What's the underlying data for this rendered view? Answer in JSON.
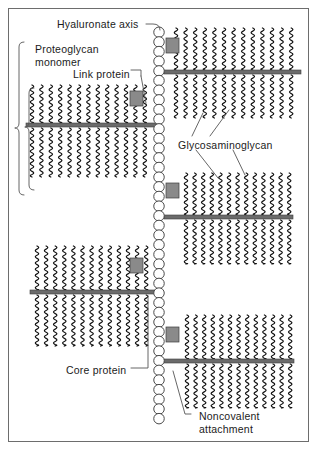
{
  "figure": {
    "background": "#ffffff",
    "frame_color": "#6d6d6d",
    "colors": {
      "core_protein": "#6b6b6b",
      "link_protein": "#8a8a8a",
      "gag_chain": "#111111",
      "hyaluronate_circle_stroke": "#4a4a4a",
      "leader_line": "#555555",
      "text": "#1b1b1b"
    },
    "labels": [
      {
        "id": "hyaluronate-axis",
        "text": "Hyaluronate axis",
        "x": 57,
        "y": 18,
        "lines": 1
      },
      {
        "id": "proteoglycan-monomer",
        "text": "Proteoglycan\nmonomer",
        "x": 35,
        "y": 43,
        "lines": 2
      },
      {
        "id": "link-protein",
        "text": "Link protein",
        "x": 73,
        "y": 68,
        "lines": 1
      },
      {
        "id": "glycosaminoglycan",
        "text": "Glycosaminoglycan",
        "x": 178,
        "y": 139,
        "lines": 1
      },
      {
        "id": "core-protein",
        "text": "Core protein",
        "x": 66,
        "y": 364,
        "lines": 1
      },
      {
        "id": "noncovalent-attachment",
        "text": "Noncovalent\nattachment",
        "x": 199,
        "y": 410,
        "lines": 2
      }
    ],
    "hyaluronate_axis": {
      "name": "hyaluronate-axis-chain",
      "x_center": 159,
      "y_top": 27,
      "y_bottom": 430,
      "circle_diameter": 10.5,
      "circle_count": 40
    },
    "proteoglycan_monomers": [
      {
        "id": "monomer-right-1",
        "side": "right",
        "core_y": 72,
        "core_x1": 164,
        "core_x2": 301,
        "link_x": 166,
        "link_y": 51,
        "gag_count": 13,
        "gag_top_len": 44,
        "gag_bottom_len": 46,
        "gag_x_start": 176,
        "gag_spacing": 9.6
      },
      {
        "id": "monomer-left-1",
        "side": "left",
        "core_y": 125,
        "core_x1": 26,
        "core_x2": 156,
        "link_x": 143,
        "link_y": 104,
        "gag_count": 13,
        "gag_top_len": 40,
        "gag_bottom_len": 52,
        "gag_x_start": 32,
        "gag_spacing": 9.4
      },
      {
        "id": "monomer-right-2",
        "side": "right",
        "core_y": 217,
        "core_x1": 164,
        "core_x2": 293,
        "link_x": 166,
        "link_y": 196,
        "gag_count": 13,
        "gag_top_len": 44,
        "gag_bottom_len": 47,
        "gag_x_start": 186,
        "gag_spacing": 8.6
      },
      {
        "id": "monomer-left-2",
        "side": "left",
        "core_y": 292,
        "core_x1": 30,
        "core_x2": 156,
        "link_x": 143,
        "link_y": 271,
        "gag_count": 13,
        "gag_top_len": 46,
        "gag_bottom_len": 54,
        "gag_x_start": 37,
        "gag_spacing": 9.1
      },
      {
        "id": "monomer-right-3",
        "side": "right",
        "core_y": 361,
        "core_x1": 164,
        "core_x2": 294,
        "link_x": 166,
        "link_y": 340,
        "gag_count": 13,
        "gag_top_len": 46,
        "gag_bottom_len": 47,
        "gag_x_start": 187,
        "gag_spacing": 8.6
      }
    ],
    "link_protein_square": {
      "width": 13,
      "height": 15
    },
    "core_protein_bar_height": 4,
    "brackets": [
      {
        "id": "monomer-bracket-outer",
        "x": 19,
        "y_top": 42,
        "y_bottom": 195,
        "tip_y": 128
      },
      {
        "id": "monomer-bracket-inner",
        "x": 29,
        "y_top": 88,
        "y_bottom": 190,
        "tip_y": 127
      }
    ],
    "leaders": [
      {
        "id": "leader-hyaluronate-axis",
        "path": "M146,24 L153,24 Q160,24 160,30"
      },
      {
        "id": "leader-link-protein",
        "path": "M131,70 L141,70 L141,76"
      },
      {
        "id": "leader-link-elbow",
        "path": "M141,76 L146,103"
      },
      {
        "id": "leader-gag-left",
        "path": "M192,136 L203,113"
      },
      {
        "id": "leader-gag-right",
        "path": "M210,136 L229,110"
      },
      {
        "id": "leader-gag-down-left",
        "path": "M196,150 L218,178"
      },
      {
        "id": "leader-gag-down-right",
        "path": "M233,150 L245,175"
      },
      {
        "id": "leader-core-protein",
        "path": "M131,368 L148,368 L148,296"
      },
      {
        "id": "leader-noncovalent",
        "path": "M191,414 L185,414 L173,371"
      }
    ]
  }
}
